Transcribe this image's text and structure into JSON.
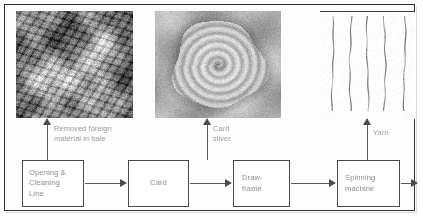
{
  "diagram": {
    "frame_color": "#2f2f2f",
    "box_border_color": "#4a4a4a",
    "text_color": "#8e8e8e",
    "arrow_color": "#5a5a5a"
  },
  "process_boxes": [
    {
      "id": "opening-cleaning-line",
      "label": "Opening &\nCleaning\nLine"
    },
    {
      "id": "card",
      "label": "Card"
    },
    {
      "id": "draw-frame",
      "label": "Draw-\nframe"
    },
    {
      "id": "spinning-machine",
      "label": "Spinning\nmachine"
    }
  ],
  "callouts": [
    {
      "id": "removed-foreign-material",
      "label": "Removed foreign\nmaterial in bale"
    },
    {
      "id": "card-sliver",
      "label": "Card\nsliver"
    },
    {
      "id": "yarn",
      "label": "Yarn"
    }
  ],
  "photos": [
    {
      "id": "foreign-material-photo",
      "caption": "Removed foreign material in bale",
      "kind": "trash"
    },
    {
      "id": "card-sliver-photo",
      "caption": "Card sliver coil",
      "kind": "sliver"
    },
    {
      "id": "yarn-photo",
      "caption": "Yarn strands",
      "kind": "yarn"
    }
  ],
  "arrows": [
    {
      "id": "opening-to-card",
      "direction": "right"
    },
    {
      "id": "card-to-drawframe",
      "direction": "right"
    },
    {
      "id": "drawframe-to-spinning",
      "direction": "right"
    },
    {
      "id": "spinning-to-output",
      "direction": "right"
    },
    {
      "id": "opening-to-photo",
      "direction": "up"
    },
    {
      "id": "card-to-photo",
      "direction": "up"
    },
    {
      "id": "spinning-to-photo",
      "direction": "up"
    }
  ]
}
